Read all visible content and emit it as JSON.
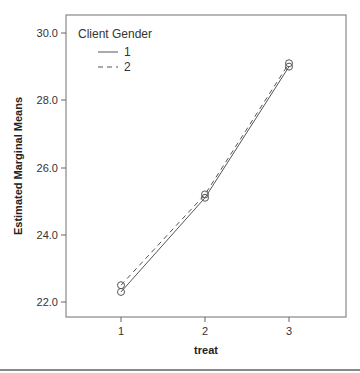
{
  "chart_data": {
    "type": "line",
    "title": "",
    "xlabel": "treat",
    "ylabel": "Estimated Marginal Means",
    "categories": [
      "1",
      "2",
      "3"
    ],
    "x": [
      1,
      2,
      3
    ],
    "yticks": [
      "22.0",
      "24.0",
      "26.0",
      "28.0",
      "30.0"
    ],
    "ylim": [
      21.6,
      30.5
    ],
    "grid": false,
    "legend": {
      "title": "Client Gender",
      "position": "top-left inside"
    },
    "series": [
      {
        "name": "1",
        "style": "solid",
        "marker": "circle",
        "values": [
          22.3,
          25.1,
          29.0
        ]
      },
      {
        "name": "2",
        "style": "dashed",
        "marker": "circle",
        "values": [
          22.5,
          25.2,
          29.1
        ]
      }
    ]
  },
  "legend": {
    "title": "Client Gender",
    "items": [
      {
        "label": "1",
        "style": "solid"
      },
      {
        "label": "2",
        "style": "dashed"
      }
    ]
  },
  "axes": {
    "x_title": "treat",
    "y_title": "Estimated Marginal Means",
    "x_ticks": [
      "1",
      "2",
      "3"
    ],
    "y_ticks": [
      "22.0",
      "24.0",
      "26.0",
      "28.0",
      "30.0"
    ]
  },
  "colors": {
    "line": "#555555",
    "frame": "#888888",
    "text": "#333333"
  }
}
